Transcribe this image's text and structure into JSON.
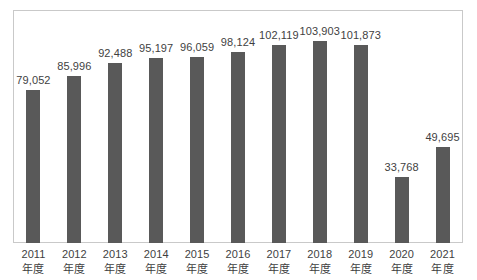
{
  "chart_data": {
    "type": "bar",
    "title": "",
    "subtitle": "",
    "xlabel": "",
    "ylabel": "",
    "categories": [
      "2011 年度",
      "2012 年度",
      "2013 年度",
      "2014 年度",
      "2015 年度",
      "2016 年度",
      "2017 年度",
      "2018 年度",
      "2019 年度",
      "2020 年度",
      "2021 年度"
    ],
    "category_years": [
      "2011",
      "2012",
      "2013",
      "2014",
      "2015",
      "2016",
      "2017",
      "2018",
      "2019",
      "2020",
      "2021"
    ],
    "category_suffix": [
      "年度",
      "年度",
      "年度",
      "年度",
      "年度",
      "年度",
      "年度",
      "年度",
      "年度",
      "年度",
      "年度"
    ],
    "values": [
      79052,
      85996,
      92488,
      95197,
      96059,
      98124,
      102119,
      103903,
      101873,
      33768,
      49695
    ],
    "value_labels": [
      "79,052",
      "85,996",
      "92,488",
      "95,197",
      "96,059",
      "98,124",
      "102,119",
      "103,903",
      "101,873",
      "33,768",
      "49,695"
    ],
    "ylim": [
      0,
      120000
    ],
    "grid": false,
    "legend": false,
    "legend_position": "none",
    "axis_tick_labels": [],
    "annotations": [],
    "colors": {
      "bar": "#595959",
      "plot_border": "#c9c9c9",
      "label_text": "#3f3f3f",
      "background": "#ffffff"
    }
  }
}
